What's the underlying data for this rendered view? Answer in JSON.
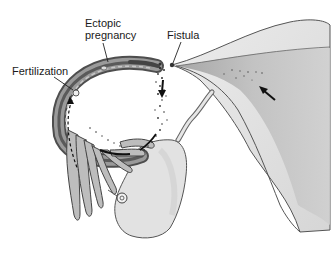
{
  "diagram": {
    "labels": {
      "ectopic_line1": "Ectopic",
      "ectopic_line2": "pregnancy",
      "fistula": "Fistula",
      "fertilization": "Fertilization"
    },
    "colors": {
      "background": "#ffffff",
      "outline": "#4a4a4a",
      "tube_dark": "#5e5e5e",
      "tissue_light": "#dcdcdc",
      "uterus_fill": "#e4e4e4",
      "uterus_shadow": "#b8b8b8",
      "text": "#1a1a1a"
    }
  }
}
